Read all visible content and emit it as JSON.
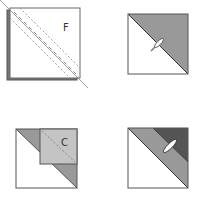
{
  "diagram": {
    "type": "quilt-block-construction-steps",
    "colors": {
      "outline": "#444444",
      "light_gray": "#c4c4c4",
      "medium_gray": "#999999",
      "dark_gray": "#555555",
      "back_square": "#777777",
      "white": "#ffffff"
    },
    "steps": [
      {
        "position": "top-left",
        "label": "F",
        "description": "Square F placed on back square, sewn along diagonal with dashed stitch lines"
      },
      {
        "position": "top-right",
        "label": "",
        "description": "Half-square triangle, gray top-right half, pressed (iron icon)"
      },
      {
        "position": "bottom-left",
        "label": "C",
        "description": "Square C placed in top-right corner, stitched along diagonal"
      },
      {
        "position": "bottom-right",
        "label": "",
        "description": "Three-tone block with dark corner, pressed (iron icon)"
      }
    ]
  }
}
